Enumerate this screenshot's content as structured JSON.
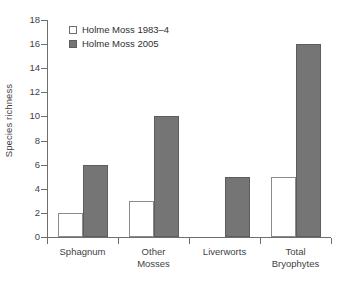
{
  "chart_data": {
    "type": "bar",
    "title": "",
    "xlabel": "",
    "ylabel": "Species richness",
    "ylim": [
      0,
      18
    ],
    "ytick_step": 2,
    "yticks": [
      18,
      16,
      14,
      12,
      10,
      8,
      6,
      4,
      2,
      0
    ],
    "grid": false,
    "legend_position": "top-left",
    "categories": [
      "Sphagnum",
      "Other\nMosses",
      "Liverworts",
      "Total\nBryophytes"
    ],
    "series": [
      {
        "name": "Holme Moss 1983–4",
        "color": "#ffffff",
        "edge_color": "#8b8b8b",
        "values": [
          2,
          3,
          0,
          5
        ]
      },
      {
        "name": "Holme Moss 2005",
        "color": "#757575",
        "edge_color": "#5d5d5d",
        "values": [
          6,
          10,
          5,
          16
        ]
      }
    ]
  },
  "legend": {
    "items": [
      {
        "label": "Holme Moss 1983–4",
        "swatch": "light"
      },
      {
        "label": "Holme Moss 2005",
        "swatch": "dark"
      }
    ]
  },
  "axes": {
    "y_label": "Species richness",
    "y_ticks": [
      "18",
      "16",
      "14",
      "12",
      "10",
      "8",
      "6",
      "4",
      "2",
      "0"
    ],
    "x_categories": [
      {
        "line1": "Sphagnum",
        "line2": ""
      },
      {
        "line1": "Other",
        "line2": "Mosses"
      },
      {
        "line1": "Liverworts",
        "line2": ""
      },
      {
        "line1": "Total",
        "line2": "Bryophytes"
      }
    ]
  },
  "colors": {
    "bar_dark": "#757575",
    "bar_light": "#ffffff",
    "axis": "#6e6e6e",
    "text": "#3f3f3f",
    "background": "#ffffff"
  }
}
